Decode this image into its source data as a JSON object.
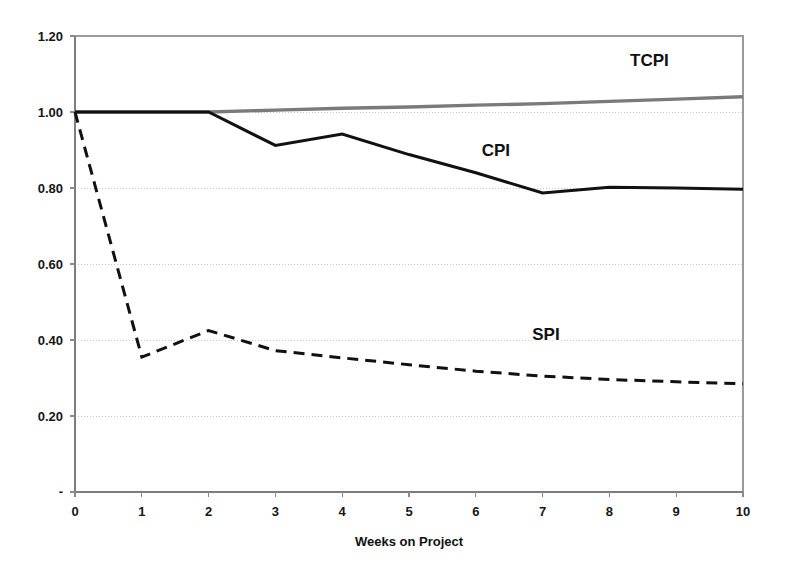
{
  "chart_data": {
    "type": "line",
    "title": "",
    "subtitle": "",
    "xlabel": "Weeks on Project",
    "ylabel": "",
    "x": [
      0,
      1,
      2,
      3,
      4,
      5,
      6,
      7,
      8,
      9,
      10
    ],
    "xlim": [
      0,
      10
    ],
    "ylim": [
      0,
      1.2
    ],
    "grid": true,
    "legend_position": "inline-annotations",
    "xtick_labels": [
      "0",
      "1",
      "2",
      "3",
      "4",
      "5",
      "6",
      "7",
      "8",
      "9",
      "10"
    ],
    "ytick_values": [
      0,
      0.2,
      0.4,
      0.6,
      0.8,
      1.0,
      1.2
    ],
    "ytick_labels": [
      "-",
      "0.20",
      "0.40",
      "0.60",
      "0.80",
      "1.00",
      "1.20"
    ],
    "series": [
      {
        "name": "TCPI",
        "values": [
          1.0,
          1.0,
          1.0,
          1.005,
          1.01,
          1.013,
          1.018,
          1.022,
          1.028,
          1.034,
          1.04
        ],
        "color": "#7a7a7a",
        "style": "solid",
        "width": 3.4,
        "label_x": 8.6,
        "label_y": 1.12
      },
      {
        "name": "CPI",
        "values": [
          1.0,
          1.0,
          1.0,
          0.912,
          0.942,
          0.888,
          0.84,
          0.787,
          0.802,
          0.8,
          0.797
        ],
        "color": "#111111",
        "style": "solid",
        "width": 3.0,
        "label_x": 6.3,
        "label_y": 0.885
      },
      {
        "name": "SPI",
        "values": [
          1.0,
          0.355,
          0.425,
          0.372,
          0.353,
          0.335,
          0.318,
          0.305,
          0.296,
          0.29,
          0.285
        ],
        "color": "#111111",
        "style": "dashed",
        "width": 3.0,
        "label_x": 7.05,
        "label_y": 0.4
      }
    ],
    "annotations": [
      {
        "text": "TCPI",
        "x": 8.6,
        "y": 1.12
      },
      {
        "text": "CPI",
        "x": 6.3,
        "y": 0.885
      },
      {
        "text": "SPI",
        "x": 7.05,
        "y": 0.4
      }
    ]
  },
  "plot": {
    "left_px": 75,
    "right_px": 743,
    "top_px": 36,
    "bottom_px": 492
  }
}
